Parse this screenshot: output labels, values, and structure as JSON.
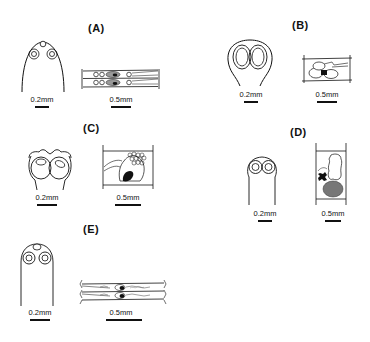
{
  "figure": {
    "panels": [
      {
        "id": "A",
        "label": "(A)",
        "left_scale": "0.2mm",
        "right_scale": "0.5mm"
      },
      {
        "id": "B",
        "label": "(B)",
        "left_scale": "0.2mm",
        "right_scale": "0.5mm"
      },
      {
        "id": "C",
        "label": "(C)",
        "left_scale": "0.2mm",
        "right_scale": "0.5mm"
      },
      {
        "id": "D",
        "label": "(D)",
        "left_scale": "0.2mm",
        "right_scale": "0.5mm"
      },
      {
        "id": "E",
        "label": "(E)",
        "left_scale": "0.2mm",
        "right_scale": "0.5mm"
      }
    ]
  }
}
